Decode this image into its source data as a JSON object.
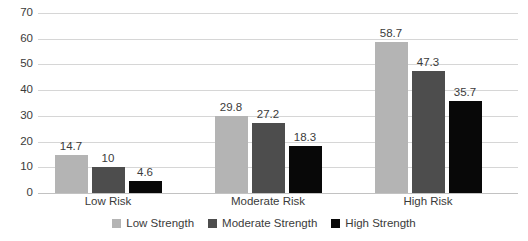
{
  "chart_data": {
    "type": "bar",
    "title": "",
    "subtitle": "",
    "xlabel": "",
    "ylabel": "",
    "categories": [
      "Low Risk",
      "Moderate Risk",
      "High Risk"
    ],
    "series": [
      {
        "name": "Low Strength",
        "color": "#b4b4b4",
        "values": [
          14.7,
          29.8,
          58.7
        ],
        "value_labels": [
          "14.7",
          "29.8",
          "58.7"
        ]
      },
      {
        "name": "Moderate Strength",
        "color": "#4d4d4d",
        "values": [
          10,
          27.2,
          47.3
        ],
        "value_labels": [
          "10",
          "27.2",
          "47.3"
        ]
      },
      {
        "name": "High Strength",
        "color": "#080808",
        "values": [
          4.6,
          18.3,
          35.7
        ],
        "value_labels": [
          "4.6",
          "18.3",
          "35.7"
        ]
      }
    ],
    "ylim": [
      0,
      70
    ],
    "yticks": [
      0,
      10,
      20,
      30,
      40,
      50,
      60,
      70
    ],
    "ytick_labels": [
      "0",
      "10",
      "20",
      "30",
      "40",
      "50",
      "60",
      "70"
    ],
    "grid": true,
    "grid_axis": "y",
    "legend_position": "bottom",
    "background_color": "#ffffff",
    "grid_color": "#d6d6d6",
    "text_color": "#3b3b3b"
  }
}
